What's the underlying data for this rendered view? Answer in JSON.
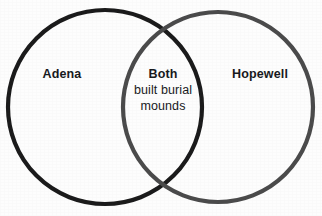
{
  "diagram": {
    "type": "venn",
    "background_color": "#fdfdfd",
    "left_set": {
      "label": "Adena",
      "stroke_color": "#1a1a1a",
      "cx": 105,
      "cy": 107,
      "r": 97
    },
    "right_set": {
      "label": "Hopewell",
      "stroke_color": "#4a4a4a",
      "cx": 218,
      "cy": 107,
      "r": 95
    },
    "intersection": {
      "title": "Both",
      "line1": "built burial",
      "line2": "mounds"
    }
  }
}
